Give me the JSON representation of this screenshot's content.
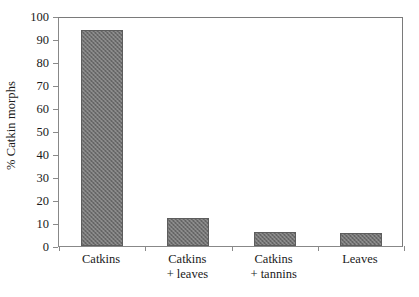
{
  "chart_data": {
    "type": "bar",
    "title": "",
    "subtitle": "",
    "xlabel": "",
    "ylabel": "% Catkin morphs",
    "categories": [
      "Catkins",
      "Catkins + leaves",
      "Catkins + tannins",
      "Leaves"
    ],
    "category_lines": [
      [
        "Catkins",
        ""
      ],
      [
        "Catkins",
        "+ leaves"
      ],
      [
        "Catkins",
        "+ tannins"
      ],
      [
        "Leaves",
        ""
      ]
    ],
    "values": [
      94,
      12,
      6,
      5.5
    ],
    "ylim": [
      0,
      100
    ],
    "ytick_step": 10,
    "yticks": [
      100,
      90,
      80,
      70,
      60,
      50,
      40,
      30,
      20,
      10,
      0
    ],
    "ytick_labels": [
      "100",
      "90",
      "80",
      "70",
      "60",
      "50",
      "40",
      "30",
      "20",
      "10",
      "0"
    ],
    "grid": false,
    "legend": false,
    "legend_position": "none",
    "bar_fill_color": "#707070",
    "bar_edge_color": "#5d5d5d",
    "bar_pattern": "crosshatch",
    "axis_color": "#8a8a8a",
    "background_color": "#ffffff",
    "frame": "full-box"
  }
}
